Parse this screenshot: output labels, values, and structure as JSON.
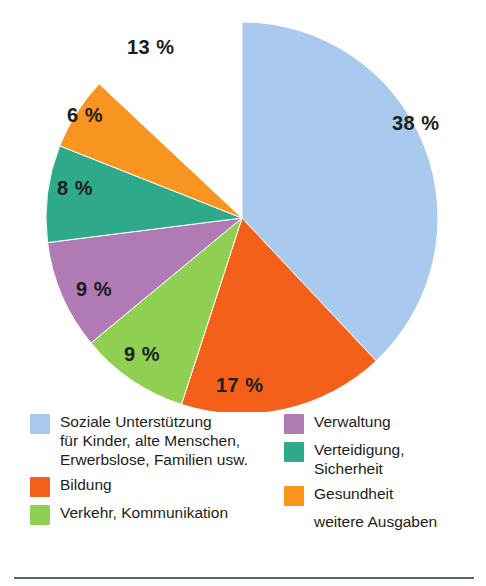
{
  "chart_data": {
    "type": "pie",
    "title": "",
    "subtitle": "",
    "xlabel": "",
    "ylabel": "",
    "legend_position": "bottom",
    "grid": false,
    "unit": "%",
    "start_angle_deg": 0,
    "direction": "clockwise",
    "categories": [
      "Soziale Unterstützung für Kinder, alte Menschen, Erwerbslose, Familien usw.",
      "Bildung",
      "Verkehr, Kommunikation",
      "Verwaltung",
      "Verteidigung, Sicherheit",
      "Gesundheit",
      "weitere Ausgaben"
    ],
    "values": [
      38,
      17,
      9,
      9,
      8,
      6,
      13
    ],
    "colors": [
      "#A9C9EE",
      "#F4601A",
      "#8FCF52",
      "#B07AB5",
      "#2EA98A",
      "#F79520",
      "#FFFFFF"
    ],
    "slices": [
      {
        "label": "Soziale Unterstützung für Kinder, alte Menschen, Erwerbslose, Familien usw.",
        "value": 38,
        "display": "38 %",
        "color": "#A9C9EE"
      },
      {
        "label": "Bildung",
        "value": 17,
        "display": "17 %",
        "color": "#F4601A"
      },
      {
        "label": "Verkehr, Kommunikation",
        "value": 9,
        "display": "9 %",
        "color": "#8FCF52"
      },
      {
        "label": "Verwaltung",
        "value": 9,
        "display": "9 %",
        "color": "#B07AB5"
      },
      {
        "label": "Verteidigung, Sicherheit",
        "value": 8,
        "display": "8 %",
        "color": "#2EA98A"
      },
      {
        "label": "Gesundheit",
        "value": 6,
        "display": "6 %",
        "color": "#F79520"
      },
      {
        "label": "weitere Ausgaben",
        "value": 13,
        "display": "13 %",
        "color": "#FFFFFF"
      }
    ]
  },
  "labels": {
    "p38": "38 %",
    "p17": "17 %",
    "p9a": "9 %",
    "p9b": "9 %",
    "p8": "8 %",
    "p6": "6 %",
    "p13": "13 %"
  },
  "legend": {
    "left": [
      {
        "label": "Soziale Unterstützung\nfür Kinder, alte Menschen,\nErwerbslose, Familien usw.",
        "color": "#A9C9EE",
        "has_swatch": true
      },
      {
        "label": "Bildung",
        "color": "#F4601A",
        "has_swatch": true
      },
      {
        "label": "Verkehr, Kommunikation",
        "color": "#8FCF52",
        "has_swatch": true
      }
    ],
    "right": [
      {
        "label": "Verwaltung",
        "color": "#B07AB5",
        "has_swatch": true
      },
      {
        "label": "Verteidigung,\nSicherheit",
        "color": "#2EA98A",
        "has_swatch": true
      },
      {
        "label": "Gesundheit",
        "color": "#F79520",
        "has_swatch": true
      },
      {
        "label": "weitere Ausgaben",
        "color": "#FFFFFF",
        "has_swatch": false
      }
    ]
  }
}
